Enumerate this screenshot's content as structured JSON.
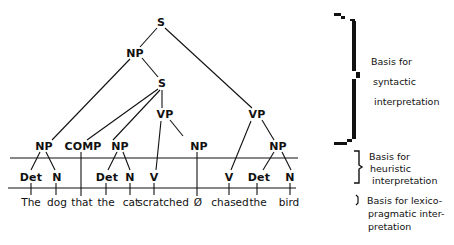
{
  "diagram": {
    "type": "syntactic-parse-tree",
    "sentence": [
      "The",
      "dog",
      "that",
      "the",
      "cat",
      "scratched",
      "Ø",
      "chased",
      "the",
      "bird"
    ],
    "nodes": {
      "s_root": "S",
      "np_subject": "NP",
      "s_relative": "S",
      "vp_relative": "VP",
      "vp_main": "VP",
      "np_1": "NP",
      "comp": "COMP",
      "np_2": "NP",
      "np_gap": "NP",
      "np_3": "NP",
      "det_1": "Det",
      "n_1": "N",
      "det_2": "Det",
      "n_2": "N",
      "v_1": "V",
      "v_2": "V",
      "det_3": "Det",
      "n_3": "N"
    },
    "words": {
      "w1": "The",
      "w2": "dog",
      "w3": "that",
      "w4": "the",
      "w5": "cat",
      "w6": "scratched",
      "w7": "Ø",
      "w8": "chased",
      "w9": "the",
      "w10": "bird"
    },
    "legend": {
      "syntactic": [
        "Basis for",
        "syntactic",
        "interpretation"
      ],
      "heuristic": [
        "Basis for",
        "heuristic",
        "interpretation"
      ],
      "lexico": [
        "Basis for lexico-",
        "pragmatic inter-",
        "pretation"
      ]
    },
    "colors": {
      "ink": "#111111",
      "background": "#ffffff"
    }
  }
}
